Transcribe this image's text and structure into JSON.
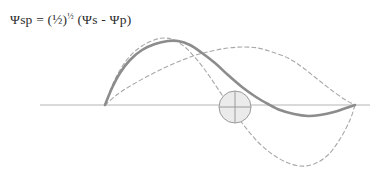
{
  "figure": {
    "width": 373,
    "height": 172,
    "background": "#ffffff",
    "caption_formula": {
      "full_text": "Ψsp = (½)½ (Ψs - Ψp)",
      "lead": "Ψsp = (½)",
      "exponent": "½",
      "trail": " (Ψs - Ψp)"
    }
  },
  "chart_data": {
    "type": "line",
    "title": "Ψsp = (½)½ (Ψs - Ψp)",
    "subtitle": "",
    "xlabel": "",
    "ylabel": "",
    "grid": false,
    "legend": "none",
    "xlim": [
      40,
      370
    ],
    "ylim": [
      -70,
      70
    ],
    "axis": {
      "name": "baseline-axis",
      "y_pixel": 105,
      "x_start_pixel": 40,
      "x_end_pixel": 370,
      "color": "#b4b4b4",
      "width": 1
    },
    "nucleus_marker": {
      "name": "nucleus-circle",
      "cx": 235,
      "cy": 107,
      "r": 16,
      "fill": "#ebebeb",
      "stroke": "#9a9a9a",
      "crosshair": true,
      "diagonal": true
    },
    "series": [
      {
        "name": "sp-hybrid-orbital",
        "label": "Ψsp",
        "style": "solid",
        "color": "#8c8c8c",
        "width": 2.6,
        "points_pixel": [
          [
            105,
            105
          ],
          [
            112,
            88
          ],
          [
            120,
            73
          ],
          [
            130,
            60
          ],
          [
            142,
            50
          ],
          [
            155,
            44
          ],
          [
            168,
            41
          ],
          [
            178,
            41
          ],
          [
            190,
            45
          ],
          [
            202,
            53
          ],
          [
            215,
            63
          ],
          [
            228,
            75
          ],
          [
            242,
            87
          ],
          [
            256,
            97
          ],
          [
            268,
            104
          ],
          [
            280,
            110
          ],
          [
            294,
            114
          ],
          [
            308,
            116
          ],
          [
            320,
            115
          ],
          [
            334,
            112
          ],
          [
            346,
            108
          ],
          [
            355,
            105
          ]
        ],
        "peak_pixel": [
          174,
          41
        ],
        "trough_pixel": [
          310,
          116
        ]
      },
      {
        "name": "s-orbital-wave",
        "label": "Ψs",
        "style": "dashed",
        "color": "#a8a8a8",
        "width": 1.1,
        "dasharray": "4,3",
        "points_pixel": [
          [
            105,
            105
          ],
          [
            112,
            86
          ],
          [
            120,
            70
          ],
          [
            130,
            56
          ],
          [
            142,
            46
          ],
          [
            154,
            40
          ],
          [
            164,
            38
          ],
          [
            174,
            40
          ],
          [
            186,
            48
          ],
          [
            198,
            61
          ],
          [
            210,
            77
          ],
          [
            222,
            95
          ],
          [
            234,
            112
          ],
          [
            246,
            128
          ],
          [
            258,
            142
          ],
          [
            272,
            154
          ],
          [
            286,
            162
          ],
          [
            300,
            166
          ],
          [
            314,
            164
          ],
          [
            328,
            155
          ],
          [
            340,
            139
          ],
          [
            350,
            120
          ],
          [
            355,
            105
          ]
        ],
        "peak_pixel": [
          167,
          38
        ],
        "trough_pixel": [
          302,
          166
        ]
      },
      {
        "name": "p-orbital-wave",
        "label": "Ψp",
        "style": "dashed",
        "color": "#a8a8a8",
        "width": 1.1,
        "dasharray": "4,3",
        "points_pixel": [
          [
            105,
            105
          ],
          [
            118,
            94
          ],
          [
            132,
            85
          ],
          [
            148,
            76
          ],
          [
            164,
            68
          ],
          [
            180,
            61
          ],
          [
            196,
            55
          ],
          [
            212,
            51
          ],
          [
            228,
            48
          ],
          [
            244,
            47
          ],
          [
            258,
            48
          ],
          [
            272,
            52
          ],
          [
            288,
            58
          ],
          [
            302,
            67
          ],
          [
            316,
            78
          ],
          [
            330,
            89
          ],
          [
            344,
            99
          ],
          [
            355,
            105
          ]
        ],
        "peak_pixel": [
          248,
          47
        ],
        "trough_pixel": null
      }
    ],
    "annotations": [
      {
        "name": "formula-annotation",
        "text": "Ψsp = (½)½ (Ψs - Ψp)",
        "x_pixel": 10,
        "y_pixel": 22,
        "color": "#2b2b2b"
      }
    ],
    "colors": {
      "solid_curve": "#8c8c8c",
      "dashed_curve": "#a8a8a8",
      "axis": "#b4b4b4",
      "text": "#2b2b2b",
      "circle_fill": "#ebebeb",
      "circle_stroke": "#9a9a9a",
      "background": "#ffffff"
    }
  }
}
